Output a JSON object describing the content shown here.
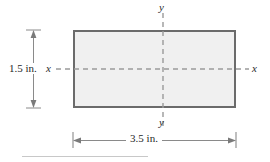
{
  "figure": {
    "kind": "cross-section-dimension-diagram",
    "shape": "rectangle",
    "axes": {
      "y_top_label": "y",
      "y_bottom_label": "y",
      "x_left_label": "x",
      "x_right_label": "x"
    },
    "dimensions": {
      "height_label": "1.5 in.",
      "width_label": "3.5 in."
    },
    "colors": {
      "shape_fill": "#f0f0f0",
      "shape_stroke": "#6b6b6b",
      "axis_line": "#9a9a9a",
      "dimension_line": "#8a8a8a",
      "text": "#1f1f1f",
      "rule": "#c8c8c8",
      "background": "#ffffff"
    },
    "geometry": {
      "rect_left": 73,
      "rect_top": 30,
      "rect_right": 236,
      "rect_bottom": 108,
      "center_x": 163,
      "center_y": 69
    }
  }
}
